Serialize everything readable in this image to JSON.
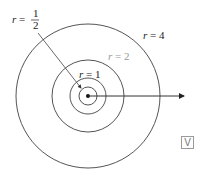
{
  "diagram": {
    "title": "",
    "center": {
      "x": 88,
      "y": 96
    },
    "circles": [
      {
        "name": "r-half",
        "label": "r = 1/2",
        "radius_px": 9
      },
      {
        "name": "r-1",
        "label": "r = 1",
        "radius_px": 18
      },
      {
        "name": "r-2",
        "label": "r = 2",
        "radius_px": 36
      },
      {
        "name": "r-4",
        "label": "r = 4",
        "radius_px": 72
      }
    ],
    "labels": {
      "r_half_prefix": "r = ",
      "r_half_num": "1",
      "r_half_den": "2",
      "r1": "r = 1",
      "r2": "r = 2",
      "r4": "r = 4"
    },
    "colors": {
      "stroke": "#555555",
      "r2_label": "#999999",
      "text": "#222222"
    },
    "badge": "V"
  }
}
